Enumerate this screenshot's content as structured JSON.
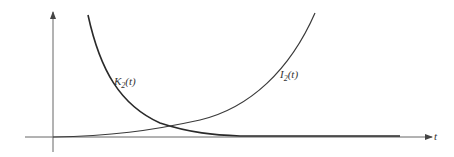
{
  "diagram": {
    "axis_label_x": "t",
    "curves": [
      {
        "name": "K",
        "subscript": "2",
        "arg": "(t)",
        "description": "decreasing curve"
      },
      {
        "name": "I",
        "subscript": "2",
        "arg": "(t)",
        "description": "increasing curve"
      }
    ],
    "colors": {
      "curve": "#2a2a2a",
      "axis": "#555555",
      "background": "#ffffff"
    }
  }
}
